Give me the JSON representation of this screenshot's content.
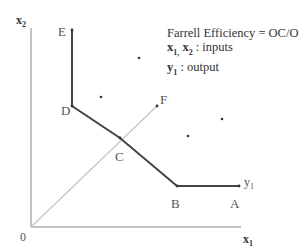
{
  "diagram": {
    "title": "Farrell Efficiency",
    "legend": {
      "line1": "Farrell Efficiency = OC/OF",
      "line2_vars": "x",
      "line2_sub1": "1,",
      "line2_sub2": "2",
      "line2_text": " : inputs",
      "line3_var": "y",
      "line3_sub": "1",
      "line3_text": "  : output"
    },
    "axes": {
      "origin_label": "0",
      "x_label": "x",
      "x_sub": "1",
      "y_label": "x",
      "y_sub": "2"
    },
    "points": {
      "A": "A",
      "B": "B",
      "C": "C",
      "D": "D",
      "E": "E",
      "F": "F"
    },
    "isoquant_label": "y",
    "isoquant_sub": "1",
    "colors": {
      "frontier": "#444444",
      "ray": "#bbbbbb",
      "axis": "#777777",
      "dot": "#333333"
    }
  }
}
